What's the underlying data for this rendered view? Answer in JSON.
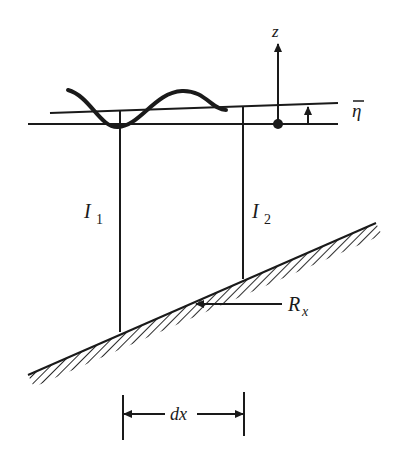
{
  "figure": {
    "labels": {
      "z_axis": "z",
      "mean_level": "η",
      "section_1": "I",
      "section_1_sub": "1",
      "section_2": "I",
      "section_2_sub": "2",
      "bottom_stress": "R",
      "bottom_stress_sub": "x",
      "width": "dx"
    },
    "colors": {
      "ink": "#1a1a1a",
      "background": "#ffffff"
    }
  }
}
